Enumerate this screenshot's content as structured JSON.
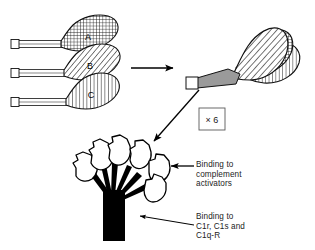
{
  "figure": {
    "width": 315,
    "height": 250,
    "background": "#ffffff",
    "ink": "#000000"
  },
  "chains": [
    {
      "id": "A",
      "label": "A",
      "pattern": "cross-hatch",
      "label_x": 88,
      "label_y": 40,
      "tail_y": 44,
      "head_cx": 82,
      "head_cy": 35
    },
    {
      "id": "B",
      "label": "B",
      "pattern": "diagonal-hatch",
      "label_x": 90,
      "label_y": 70,
      "tail_y": 73,
      "head_cx": 84,
      "head_cy": 64
    },
    {
      "id": "C",
      "label": "C",
      "pattern": "vertical-hatch",
      "label_x": 91,
      "label_y": 98,
      "tail_y": 102,
      "head_cx": 85,
      "head_cy": 93
    }
  ],
  "monomer": {
    "stalk_color": "#9a9a9a",
    "cap_color": "#ffffff",
    "heads": [
      {
        "id": "A",
        "pattern": "cross-hatch"
      },
      {
        "id": "B",
        "pattern": "diagonal-hatch"
      },
      {
        "id": "C",
        "pattern": "vertical-hatch"
      }
    ]
  },
  "multiplier": {
    "label": "× 6",
    "box_x": 199,
    "box_y": 108,
    "box_w": 26,
    "box_h": 22
  },
  "bouquet": {
    "head_count": 6,
    "head_fill": "#ffffff",
    "stalk_fill": "#000000",
    "trunk_fill": "#000000"
  },
  "arrows": {
    "assembly": {
      "label": "assembly-arrow",
      "x1": 131,
      "y1": 68,
      "x2": 177,
      "y2": 68
    },
    "oligomerize": {
      "label": "oligomerization-arrow",
      "x1": 199,
      "y1": 90,
      "x2": 151,
      "y2": 144
    },
    "binding_top": {
      "label": "complement-activator-arrow",
      "x1": 194,
      "y1": 166,
      "x2": 168,
      "y2": 166
    },
    "binding_bottom": {
      "label": "c1r-c1s-arrow",
      "x1": 194,
      "y1": 224,
      "x2": 137,
      "y2": 215
    }
  },
  "annotations": {
    "complement": "Binding to\ncomplement\nactivators",
    "receptors": "Binding to\nC1r, C1s and\nC1q-R"
  }
}
